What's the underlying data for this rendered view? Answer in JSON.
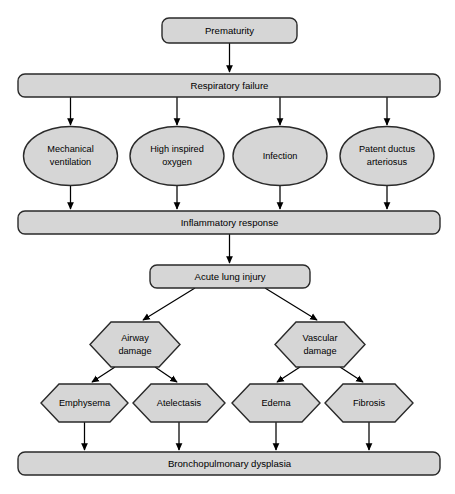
{
  "diagram": {
    "colors": {
      "shape_fill": "#d6d6d6",
      "shape_stroke": "#2a2a2a",
      "arrow": "#000000",
      "background": "#ffffff",
      "text": "#000000"
    },
    "nodes": {
      "prematurity": {
        "label": "Prematurity",
        "shape": "rounded-rect"
      },
      "respiratory_failure": {
        "label": "Respiratory failure",
        "shape": "rounded-bar"
      },
      "mechanical_ventilation": {
        "label_line1": "Mechanical",
        "label_line2": "ventilation",
        "shape": "ellipse"
      },
      "high_inspired_oxygen": {
        "label_line1": "High inspired",
        "label_line2": "oxygen",
        "shape": "ellipse"
      },
      "infection": {
        "label_line1": "Infection",
        "label_line2": "",
        "shape": "ellipse"
      },
      "patent_ductus_arteriosus": {
        "label_line1": "Patent ductus",
        "label_line2": "arteriosus",
        "shape": "ellipse"
      },
      "inflammatory_response": {
        "label": "Inflammatory response",
        "shape": "rounded-bar"
      },
      "acute_lung_injury": {
        "label": "Acute lung injury",
        "shape": "rounded-rect"
      },
      "airway_damage": {
        "label_line1": "Airway",
        "label_line2": "damage",
        "shape": "hexagon"
      },
      "vascular_damage": {
        "label_line1": "Vascular",
        "label_line2": "damage",
        "shape": "hexagon"
      },
      "emphysema": {
        "label": "Emphysema",
        "shape": "hexagon"
      },
      "atelectasis": {
        "label": "Atelectasis",
        "shape": "hexagon"
      },
      "edema": {
        "label": "Edema",
        "shape": "hexagon"
      },
      "fibrosis": {
        "label": "Fibrosis",
        "shape": "hexagon"
      },
      "bronchopulmonary_dysplasia": {
        "label": "Bronchopulmonary dysplasia",
        "shape": "rounded-bar"
      }
    },
    "edges": [
      {
        "from": "prematurity",
        "to": "respiratory_failure"
      },
      {
        "from": "respiratory_failure",
        "to": "mechanical_ventilation"
      },
      {
        "from": "respiratory_failure",
        "to": "high_inspired_oxygen"
      },
      {
        "from": "respiratory_failure",
        "to": "infection"
      },
      {
        "from": "respiratory_failure",
        "to": "patent_ductus_arteriosus"
      },
      {
        "from": "mechanical_ventilation",
        "to": "inflammatory_response"
      },
      {
        "from": "high_inspired_oxygen",
        "to": "inflammatory_response"
      },
      {
        "from": "infection",
        "to": "inflammatory_response"
      },
      {
        "from": "patent_ductus_arteriosus",
        "to": "inflammatory_response"
      },
      {
        "from": "inflammatory_response",
        "to": "acute_lung_injury"
      },
      {
        "from": "acute_lung_injury",
        "to": "airway_damage"
      },
      {
        "from": "acute_lung_injury",
        "to": "vascular_damage"
      },
      {
        "from": "airway_damage",
        "to": "emphysema"
      },
      {
        "from": "airway_damage",
        "to": "atelectasis"
      },
      {
        "from": "vascular_damage",
        "to": "edema"
      },
      {
        "from": "vascular_damage",
        "to": "fibrosis"
      },
      {
        "from": "emphysema",
        "to": "bronchopulmonary_dysplasia"
      },
      {
        "from": "atelectasis",
        "to": "bronchopulmonary_dysplasia"
      },
      {
        "from": "edema",
        "to": "bronchopulmonary_dysplasia"
      },
      {
        "from": "fibrosis",
        "to": "bronchopulmonary_dysplasia"
      }
    ]
  }
}
